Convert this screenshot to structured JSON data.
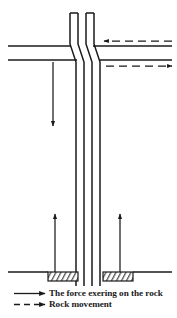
{
  "figure": {
    "background_color": "#ffffff",
    "line_color": "#1a1a1a",
    "width": 177,
    "height": 318
  },
  "legend": {
    "items": [
      {
        "symbol": "solid-arrow-right",
        "label": "The force exering on the rock",
        "line_style": "solid"
      },
      {
        "symbol": "dashed-arrow-right",
        "label": "Rock movement",
        "line_style": "dashed"
      }
    ]
  },
  "diagram": {
    "column": {
      "name": "vertical-dike-column",
      "top_y": 13,
      "bottom_y": 286,
      "upper_left_strip_x": [
        70,
        78
      ],
      "upper_right_strip_x": [
        86,
        94
      ],
      "lower_left_strip_x": [
        76,
        84
      ],
      "lower_right_strip_x": [
        92,
        100
      ],
      "kink_top_y": 44,
      "kink_bottom_y": 62,
      "description": "Two parallel vertical bands offset laterally across a horizontal shear band"
    },
    "horizontal_band": {
      "name": "horizontal-shear-band",
      "upper_line_y": 46,
      "lower_line_y": 60,
      "left_x": 8,
      "right_x": 172
    },
    "ground_line": {
      "name": "ground-surface-line",
      "y": 272,
      "left_x": 8,
      "right_x": 172
    },
    "hatched_blocks": [
      {
        "name": "hatched-block-left",
        "x": 48,
        "y": 272,
        "width": 30,
        "height": 9
      },
      {
        "name": "hatched-block-right",
        "x": 103,
        "y": 272,
        "width": 30,
        "height": 9
      }
    ],
    "arrows": [
      {
        "name": "force-arrow-down",
        "type": "force",
        "style": "solid",
        "direction": "down",
        "x": 53,
        "y_start": 62,
        "y_end": 126
      },
      {
        "name": "force-arrow-up-left",
        "type": "force",
        "style": "solid",
        "direction": "up",
        "x": 55,
        "y_start": 272,
        "y_end": 214
      },
      {
        "name": "force-arrow-up-right",
        "type": "force",
        "style": "solid",
        "direction": "up",
        "x": 120,
        "y_start": 272,
        "y_end": 214
      },
      {
        "name": "movement-arrow-left",
        "type": "movement",
        "style": "dashed",
        "direction": "left",
        "y": 41,
        "x_start": 172,
        "x_end": 104
      },
      {
        "name": "movement-arrow-right",
        "type": "movement",
        "style": "dashed",
        "direction": "right",
        "y": 66,
        "x_start": 106,
        "x_end": 172
      }
    ]
  }
}
